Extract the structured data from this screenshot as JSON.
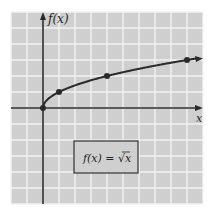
{
  "chart_data": {
    "type": "line",
    "title": "",
    "function_label": "f(x) = √x",
    "xlabel": "x",
    "ylabel": "f(x)",
    "x": [
      0,
      1,
      4,
      9
    ],
    "y": [
      0,
      1,
      2,
      3
    ],
    "highlighted_points": [
      [
        0,
        0
      ],
      [
        1,
        1
      ],
      [
        4,
        2
      ],
      [
        9,
        3
      ]
    ],
    "xlim": [
      -2,
      10
    ],
    "ylim": [
      -6,
      6
    ],
    "grid": true,
    "grid_spacing": 1,
    "legend": "none",
    "colors": {
      "background": "#cfcfcf",
      "grid": "#f2f2f2",
      "curve": "#2a2a2a",
      "axis": "#2a2a2a"
    }
  },
  "labels": {
    "y_axis": "f(x)",
    "x_axis": "x",
    "formula_left": "f(x) = ",
    "formula_radical": "√",
    "formula_radicand": "x"
  }
}
